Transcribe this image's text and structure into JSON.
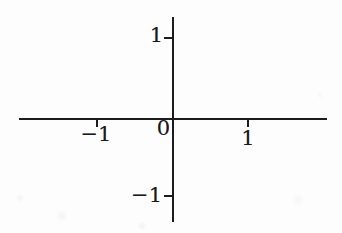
{
  "figure": {
    "origin_label": "0"
  },
  "colors": {
    "axis": "#1c1c1c",
    "label": "#1a1a1a",
    "background": "#fdfdfd"
  },
  "chart_data": {
    "type": "line",
    "series": [],
    "title": "",
    "xlabel": "",
    "ylabel": "",
    "x_ticks": [
      -1,
      0,
      1
    ],
    "x_tick_labels": [
      "−1",
      "0",
      "1"
    ],
    "y_ticks": [
      1,
      -1
    ],
    "y_tick_labels": [
      "1",
      "−1"
    ],
    "xlim": [
      -2.05,
      2.05
    ],
    "ylim": [
      -1.35,
      1.3
    ],
    "grid": false,
    "legend": false,
    "note": "Axes only; no data points plotted"
  }
}
